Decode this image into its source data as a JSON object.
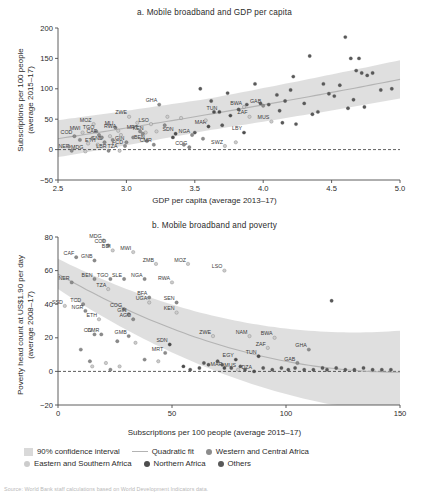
{
  "figure": {
    "source_note": "Source: World Bank staff calculations based on World Development Indicators data."
  },
  "legend": {
    "items": [
      {
        "label": "90% confidence interval",
        "marker": "box",
        "color": "#d9d9d9"
      },
      {
        "label": "Quadratic fit",
        "marker": "line",
        "color": "#b3b3b3"
      },
      {
        "label": "Western and Central Africa",
        "marker": "dot",
        "color": "#8c8c8c"
      },
      {
        "label": "Eastern and Southern Africa",
        "marker": "dot",
        "color": "#cccccc"
      },
      {
        "label": "Northern Africa",
        "marker": "dot",
        "color": "#4d4d4d"
      },
      {
        "label": "Others",
        "marker": "dot",
        "color": "#595959"
      }
    ]
  },
  "chart_data": [
    {
      "id": "panel_a",
      "type": "scatter",
      "title": "a. Mobile broadband and GDP per capita",
      "xlabel": "GDP per capita (average 2013–17)",
      "ylabel": "Subscriptions per 100 people\n(average 2015–17)",
      "xlim": [
        2.5,
        5.0
      ],
      "ylim": [
        -50,
        200
      ],
      "xticks": [
        "2.5",
        "3.0",
        "3.5",
        "4.0",
        "4.5",
        "5.0"
      ],
      "yticks": [
        "200",
        "150",
        "100",
        "50",
        "0",
        "−50"
      ],
      "grid": false,
      "zero_line": true,
      "fit": "quadratic",
      "confidence": "90%",
      "points": [
        {
          "x": 2.62,
          "y": 22,
          "label": "COD",
          "group": "wca"
        },
        {
          "x": 2.6,
          "y": -2,
          "label": "NER",
          "group": "wca"
        },
        {
          "x": 2.68,
          "y": 28,
          "label": "MWI",
          "group": "esa"
        },
        {
          "x": 2.7,
          "y": -3,
          "label": "MDG",
          "group": "esa"
        },
        {
          "x": 2.76,
          "y": 42,
          "label": "MOZ",
          "group": "esa"
        },
        {
          "x": 2.78,
          "y": 30,
          "label": "TGO",
          "group": "wca"
        },
        {
          "x": 2.8,
          "y": 24,
          "label": "CAF",
          "group": "wca"
        },
        {
          "x": 2.79,
          "y": 8,
          "label": "ETH",
          "group": "esa"
        },
        {
          "x": 2.84,
          "y": 12,
          "label": "GNB",
          "group": "wca"
        },
        {
          "x": 2.87,
          "y": -2,
          "label": "LBR",
          "group": "wca"
        },
        {
          "x": 2.92,
          "y": 36,
          "label": "MLI",
          "group": "wca"
        },
        {
          "x": 2.94,
          "y": 31,
          "label": "RWA",
          "group": "esa"
        },
        {
          "x": 2.95,
          "y": -2,
          "label": "TZA",
          "group": "esa"
        },
        {
          "x": 2.99,
          "y": 6,
          "label": "FCD",
          "group": "wca"
        },
        {
          "x": 3.0,
          "y": 12,
          "label": "GIN",
          "group": "wca"
        },
        {
          "x": 3.02,
          "y": 54,
          "label": "ZWE",
          "group": "esa"
        },
        {
          "x": 3.1,
          "y": 30,
          "label": "MRT",
          "group": "wca"
        },
        {
          "x": 3.14,
          "y": 28,
          "label": "KEN",
          "group": "esa"
        },
        {
          "x": 3.15,
          "y": 14,
          "label": "BEN",
          "group": "wca"
        },
        {
          "x": 3.18,
          "y": 42,
          "label": "LSO",
          "group": "esa"
        },
        {
          "x": 3.2,
          "y": 8,
          "label": "CMR",
          "group": "wca"
        },
        {
          "x": 3.24,
          "y": 74,
          "label": "GHA",
          "group": "wca"
        },
        {
          "x": 3.36,
          "y": 26,
          "label": "SDN",
          "group": "na"
        },
        {
          "x": 3.48,
          "y": 24,
          "label": "NGA",
          "group": "wca"
        },
        {
          "x": 3.46,
          "y": 4,
          "label": "COG",
          "group": "wca"
        },
        {
          "x": 3.6,
          "y": 38,
          "label": "MAR",
          "group": "na"
        },
        {
          "x": 3.68,
          "y": 62,
          "label": "TUN",
          "group": "na"
        },
        {
          "x": 3.72,
          "y": 6,
          "label": "SWZ",
          "group": "esa"
        },
        {
          "x": 3.86,
          "y": 70,
          "label": "BWA",
          "group": "esa"
        },
        {
          "x": 3.9,
          "y": 54,
          "label": "ZAF",
          "group": "esa"
        },
        {
          "x": 3.86,
          "y": 28,
          "label": "LBY",
          "group": "na"
        },
        {
          "x": 4.0,
          "y": 72,
          "label": "GAB",
          "group": "wca"
        },
        {
          "x": 4.06,
          "y": 46,
          "label": "MUS",
          "group": "esa"
        },
        {
          "x": 2.58,
          "y": 5,
          "group": "wca"
        },
        {
          "x": 2.66,
          "y": 16,
          "group": "wca"
        },
        {
          "x": 2.72,
          "y": 10,
          "group": "esa"
        },
        {
          "x": 2.75,
          "y": 18,
          "group": "wca"
        },
        {
          "x": 2.82,
          "y": 20,
          "group": "wca"
        },
        {
          "x": 2.88,
          "y": 22,
          "group": "esa"
        },
        {
          "x": 2.9,
          "y": 16,
          "group": "wca"
        },
        {
          "x": 2.96,
          "y": 24,
          "group": "esa"
        },
        {
          "x": 3.05,
          "y": 20,
          "group": "wca"
        },
        {
          "x": 3.08,
          "y": 44,
          "group": "esa"
        },
        {
          "x": 3.12,
          "y": 26,
          "group": "wca"
        },
        {
          "x": 3.22,
          "y": 30,
          "group": "esa"
        },
        {
          "x": 3.28,
          "y": 40,
          "group": "wca"
        },
        {
          "x": 3.3,
          "y": 54,
          "group": "esa"
        },
        {
          "x": 3.34,
          "y": 20,
          "group": "na"
        },
        {
          "x": 3.4,
          "y": 52,
          "group": "esa"
        },
        {
          "x": 3.42,
          "y": 8,
          "group": "wca"
        },
        {
          "x": 3.5,
          "y": 28,
          "group": "other"
        },
        {
          "x": 3.54,
          "y": 100,
          "group": "other"
        },
        {
          "x": 3.56,
          "y": 18,
          "group": "wca"
        },
        {
          "x": 3.58,
          "y": 48,
          "group": "esa"
        },
        {
          "x": 3.62,
          "y": 80,
          "group": "other"
        },
        {
          "x": 3.64,
          "y": 62,
          "group": "na"
        },
        {
          "x": 3.7,
          "y": 40,
          "group": "other"
        },
        {
          "x": 3.74,
          "y": 93,
          "group": "other"
        },
        {
          "x": 3.76,
          "y": 56,
          "group": "na"
        },
        {
          "x": 3.8,
          "y": 12,
          "group": "esa"
        },
        {
          "x": 3.82,
          "y": 66,
          "group": "other"
        },
        {
          "x": 3.88,
          "y": 74,
          "group": "other"
        },
        {
          "x": 3.94,
          "y": 108,
          "group": "other"
        },
        {
          "x": 3.98,
          "y": 76,
          "group": "other"
        },
        {
          "x": 4.04,
          "y": 74,
          "group": "other"
        },
        {
          "x": 4.1,
          "y": 90,
          "group": "other"
        },
        {
          "x": 4.12,
          "y": 64,
          "group": "other"
        },
        {
          "x": 4.14,
          "y": 44,
          "group": "other"
        },
        {
          "x": 4.16,
          "y": 80,
          "group": "other"
        },
        {
          "x": 4.2,
          "y": 98,
          "group": "other"
        },
        {
          "x": 4.22,
          "y": 120,
          "group": "other"
        },
        {
          "x": 4.24,
          "y": 42,
          "group": "other"
        },
        {
          "x": 4.3,
          "y": 76,
          "group": "other"
        },
        {
          "x": 4.34,
          "y": 154,
          "group": "other"
        },
        {
          "x": 4.36,
          "y": 58,
          "group": "other"
        },
        {
          "x": 4.4,
          "y": 62,
          "group": "other"
        },
        {
          "x": 4.44,
          "y": 108,
          "group": "other"
        },
        {
          "x": 4.48,
          "y": 92,
          "group": "other"
        },
        {
          "x": 4.52,
          "y": 88,
          "group": "other"
        },
        {
          "x": 4.56,
          "y": 106,
          "group": "other"
        },
        {
          "x": 4.6,
          "y": 185,
          "group": "other"
        },
        {
          "x": 4.62,
          "y": 68,
          "group": "other"
        },
        {
          "x": 4.64,
          "y": 150,
          "group": "other"
        },
        {
          "x": 4.66,
          "y": 82,
          "group": "other"
        },
        {
          "x": 4.68,
          "y": 130,
          "group": "other"
        },
        {
          "x": 4.7,
          "y": 150,
          "group": "other"
        },
        {
          "x": 4.72,
          "y": 126,
          "group": "other"
        },
        {
          "x": 4.74,
          "y": 70,
          "group": "other"
        },
        {
          "x": 4.76,
          "y": 122,
          "group": "other"
        },
        {
          "x": 4.8,
          "y": 126,
          "group": "other"
        },
        {
          "x": 4.86,
          "y": 98,
          "group": "other"
        },
        {
          "x": 4.94,
          "y": 100,
          "group": "other"
        }
      ]
    },
    {
      "id": "panel_b",
      "type": "scatter",
      "title": "b. Mobile broadband and poverty",
      "xlabel": "Subscriptions per 100 people (average 2015–17)",
      "ylabel": "Poverty head count at US$1.90 per day\n(average 2008–17)",
      "xlim": [
        0,
        150
      ],
      "ylim": [
        -20,
        80
      ],
      "xticks": [
        "0",
        "50",
        "100",
        "150"
      ],
      "yticks": [
        "80",
        "60",
        "40",
        "20",
        "0",
        "−20"
      ],
      "grid": false,
      "zero_line": true,
      "fit": "quadratic",
      "confidence": "90%",
      "points": [
        {
          "x": 20,
          "y": 78,
          "label": "MDG",
          "group": "esa"
        },
        {
          "x": 22,
          "y": 75,
          "label": "COD",
          "group": "wca"
        },
        {
          "x": 24,
          "y": 72,
          "label": "BDI",
          "group": "esa"
        },
        {
          "x": 33,
          "y": 71,
          "label": "MWI",
          "group": "esa"
        },
        {
          "x": 8,
          "y": 68,
          "label": "CAF",
          "group": "wca"
        },
        {
          "x": 16,
          "y": 66,
          "label": "GNB",
          "group": "wca"
        },
        {
          "x": 43,
          "y": 64,
          "label": "ZMB",
          "group": "esa"
        },
        {
          "x": 57,
          "y": 64,
          "label": "MOZ",
          "group": "esa"
        },
        {
          "x": 73,
          "y": 60,
          "label": "LSO",
          "group": "esa"
        },
        {
          "x": 6,
          "y": 53,
          "label": "NER",
          "group": "wca"
        },
        {
          "x": 16,
          "y": 55,
          "label": "BEN",
          "group": "wca"
        },
        {
          "x": 23,
          "y": 55,
          "label": "TGO",
          "group": "wca"
        },
        {
          "x": 29,
          "y": 55,
          "label": "SLE",
          "group": "wca"
        },
        {
          "x": 38,
          "y": 55,
          "label": "NGA",
          "group": "wca"
        },
        {
          "x": 50,
          "y": 53,
          "label": "RWA",
          "group": "esa"
        },
        {
          "x": 22,
          "y": 49,
          "label": "TZA",
          "group": "esa"
        },
        {
          "x": 40,
          "y": 44,
          "label": "BFA",
          "group": "wca"
        },
        {
          "x": 40,
          "y": 41,
          "label": "UGA",
          "group": "esa"
        },
        {
          "x": 52,
          "y": 41,
          "label": "SEN",
          "group": "wca"
        },
        {
          "x": 3,
          "y": 39,
          "label": "SSD",
          "group": "esa"
        },
        {
          "x": 11,
          "y": 40,
          "label": "TCD",
          "group": "wca"
        },
        {
          "x": 12,
          "y": 36,
          "label": "NGR",
          "group": "wca"
        },
        {
          "x": 29,
          "y": 37,
          "label": "COG",
          "group": "wca"
        },
        {
          "x": 31,
          "y": 34,
          "label": "GIN",
          "group": "wca"
        },
        {
          "x": 52,
          "y": 35,
          "label": "KEN",
          "group": "esa"
        },
        {
          "x": 18,
          "y": 31,
          "label": "ETH",
          "group": "esa"
        },
        {
          "x": 33,
          "y": 31,
          "label": "AGO",
          "group": "wca"
        },
        {
          "x": 16,
          "y": 22,
          "label": "CIV",
          "group": "wca"
        },
        {
          "x": 19,
          "y": 22,
          "label": "CMR",
          "group": "wca"
        },
        {
          "x": 31,
          "y": 21,
          "label": "GMB",
          "group": "wca"
        },
        {
          "x": 49,
          "y": 16,
          "label": "SDN",
          "group": "na"
        },
        {
          "x": 47,
          "y": 11,
          "label": "MRT",
          "group": "wca"
        },
        {
          "x": 68,
          "y": 21,
          "label": "ZWE",
          "group": "esa"
        },
        {
          "x": 84,
          "y": 21,
          "label": "NAM",
          "group": "esa"
        },
        {
          "x": 95,
          "y": 20,
          "label": "BWA",
          "group": "esa"
        },
        {
          "x": 92,
          "y": 14,
          "label": "ZAF",
          "group": "esa"
        },
        {
          "x": 88,
          "y": 9,
          "label": "TUN",
          "group": "na"
        },
        {
          "x": 78,
          "y": 7,
          "label": "EGY",
          "group": "na"
        },
        {
          "x": 73,
          "y": 2,
          "label": "MAR",
          "group": "na"
        },
        {
          "x": 79,
          "y": 1,
          "label": "MUS",
          "group": "esa"
        },
        {
          "x": 86,
          "y": 0,
          "label": "DZA",
          "group": "na"
        },
        {
          "x": 105,
          "y": 5,
          "label": "GAB",
          "group": "wca"
        },
        {
          "x": 110,
          "y": 13,
          "label": "GHA",
          "group": "wca"
        },
        {
          "x": 10,
          "y": 13,
          "group": "wca"
        },
        {
          "x": 14,
          "y": 6,
          "group": "wca"
        },
        {
          "x": 15,
          "y": 3,
          "group": "esa"
        },
        {
          "x": 21,
          "y": 5,
          "group": "esa"
        },
        {
          "x": 23,
          "y": 1,
          "group": "wca"
        },
        {
          "x": 27,
          "y": 3,
          "group": "esa"
        },
        {
          "x": 26,
          "y": 18,
          "group": "wca"
        },
        {
          "x": 34,
          "y": 17,
          "group": "esa"
        },
        {
          "x": 38,
          "y": 7,
          "group": "wca"
        },
        {
          "x": 44,
          "y": 6,
          "group": "esa"
        },
        {
          "x": 55,
          "y": 3,
          "group": "na"
        },
        {
          "x": 58,
          "y": 1,
          "group": "other"
        },
        {
          "x": 62,
          "y": 2,
          "group": "other"
        },
        {
          "x": 64,
          "y": 5,
          "group": "other"
        },
        {
          "x": 66,
          "y": 4,
          "group": "other"
        },
        {
          "x": 70,
          "y": 6,
          "group": "other"
        },
        {
          "x": 72,
          "y": 4,
          "group": "other"
        },
        {
          "x": 76,
          "y": 2,
          "group": "other"
        },
        {
          "x": 80,
          "y": 3,
          "group": "other"
        },
        {
          "x": 82,
          "y": 1,
          "group": "other"
        },
        {
          "x": 90,
          "y": 2,
          "group": "other"
        },
        {
          "x": 94,
          "y": 1,
          "group": "other"
        },
        {
          "x": 98,
          "y": 2,
          "group": "other"
        },
        {
          "x": 101,
          "y": 1,
          "group": "other"
        },
        {
          "x": 104,
          "y": 2,
          "group": "other"
        },
        {
          "x": 108,
          "y": 1,
          "group": "other"
        },
        {
          "x": 112,
          "y": 1,
          "group": "other"
        },
        {
          "x": 116,
          "y": 2,
          "group": "other"
        },
        {
          "x": 118,
          "y": 1,
          "group": "other"
        },
        {
          "x": 122,
          "y": 2,
          "group": "other"
        },
        {
          "x": 126,
          "y": 1,
          "group": "other"
        },
        {
          "x": 130,
          "y": 1,
          "group": "other"
        },
        {
          "x": 134,
          "y": 2,
          "group": "other"
        },
        {
          "x": 138,
          "y": 1,
          "group": "other"
        },
        {
          "x": 142,
          "y": 1,
          "group": "other"
        },
        {
          "x": 146,
          "y": 1,
          "group": "other"
        },
        {
          "x": 120,
          "y": 42,
          "group": "other"
        }
      ]
    }
  ],
  "colors": {
    "wca": "#8c8c8c",
    "esa": "#cccccc",
    "na": "#4d4d4d",
    "other": "#595959",
    "band": "#d9d9d9",
    "fit": "#b3b3b3",
    "axis": "#4d4d4d"
  }
}
